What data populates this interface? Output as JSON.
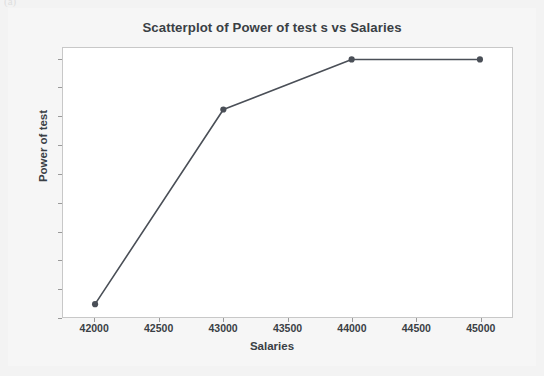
{
  "page": {
    "background_color": "#f3f3f3",
    "panel_color": "#f6f6f6",
    "scan_artifact_text": "(a)"
  },
  "chart_data": {
    "type": "scatter",
    "title": "Scatterplot of Power of test s vs Salaries",
    "xlabel": "Salaries",
    "ylabel": "Power of test",
    "x": [
      42000,
      43000,
      44000,
      45000
    ],
    "values": [
      0.145,
      0.825,
      1.0,
      1.0
    ],
    "series": [
      {
        "name": "Power of test s",
        "x": [
          42000,
          43000,
          44000,
          45000
        ],
        "values": [
          0.145,
          0.825,
          1.0,
          1.0
        ]
      }
    ],
    "xlim": [
      41750,
      45250
    ],
    "ylim": [
      0.1,
      1.04
    ],
    "xticks": [
      42000,
      42500,
      43000,
      43500,
      44000,
      44500,
      45000
    ],
    "xtick_labels": [
      "42000",
      "42500",
      "43000",
      "43500",
      "44000",
      "44500",
      "45000"
    ],
    "yticks": [
      0.1,
      0.2,
      0.3,
      0.4,
      0.5,
      0.6,
      0.7,
      0.8,
      0.9,
      1.0
    ],
    "ytick_labels": [
      "0.1",
      "0.2",
      "0.3",
      "0.4",
      "0.5",
      "0.6",
      "0.7",
      "0.8",
      "0.9",
      "1.0"
    ],
    "grid": false,
    "legend": false,
    "legend_position": "none",
    "connected": true,
    "marker": "circle",
    "line_color": "#4a4f57",
    "marker_color": "#4a4f57",
    "plot_background": "#ffffff",
    "frame_color": "#c8c8c8",
    "text_color": "#3a3f45"
  }
}
